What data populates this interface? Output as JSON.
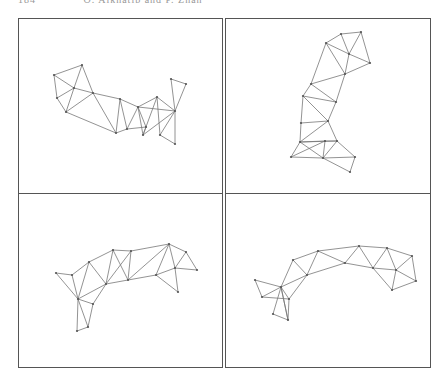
{
  "header": {
    "page_number": "184",
    "running_title": "O. Alkhatib and P. Zhan"
  },
  "colors": {
    "border": "#555555",
    "edge": "#777777",
    "vertex": "#555555"
  },
  "figure": {
    "layout": "2x2 grid of mesh panels",
    "panels": [
      {
        "id": "top-left",
        "box": [
          18,
          18,
          205,
          176
        ],
        "points": [
          [
            54,
            75
          ],
          [
            82,
            65
          ],
          [
            74,
            88
          ],
          [
            57,
            98
          ],
          [
            66,
            112
          ],
          [
            93,
            93
          ],
          [
            116,
            133
          ],
          [
            120,
            99
          ],
          [
            127,
            129
          ],
          [
            146,
            127
          ],
          [
            138,
            107
          ],
          [
            143,
            135
          ],
          [
            157,
            97
          ],
          [
            171,
            79
          ],
          [
            186,
            84
          ],
          [
            175,
            111
          ],
          [
            160,
            135
          ],
          [
            175,
            144
          ]
        ],
        "edges": [
          [
            0,
            1
          ],
          [
            0,
            2
          ],
          [
            0,
            3
          ],
          [
            1,
            2
          ],
          [
            1,
            5
          ],
          [
            2,
            3
          ],
          [
            2,
            4
          ],
          [
            2,
            5
          ],
          [
            3,
            4
          ],
          [
            4,
            5
          ],
          [
            4,
            6
          ],
          [
            5,
            6
          ],
          [
            5,
            7
          ],
          [
            6,
            7
          ],
          [
            6,
            8
          ],
          [
            7,
            8
          ],
          [
            7,
            10
          ],
          [
            8,
            10
          ],
          [
            8,
            9
          ],
          [
            9,
            10
          ],
          [
            10,
            11
          ],
          [
            9,
            11
          ],
          [
            10,
            12
          ],
          [
            11,
            12
          ],
          [
            10,
            15
          ],
          [
            12,
            15
          ],
          [
            13,
            14
          ],
          [
            13,
            15
          ],
          [
            14,
            15
          ],
          [
            12,
            16
          ],
          [
            15,
            16
          ],
          [
            15,
            17
          ],
          [
            16,
            17
          ],
          [
            11,
            15
          ]
        ]
      },
      {
        "id": "top-right",
        "box": [
          225,
          18,
          205,
          176
        ],
        "points": [
          [
            341,
            34
          ],
          [
            361,
            32
          ],
          [
            326,
            43
          ],
          [
            349,
            54
          ],
          [
            370,
            63
          ],
          [
            345,
            74
          ],
          [
            311,
            84
          ],
          [
            303,
            96
          ],
          [
            336,
            102
          ],
          [
            301,
            123
          ],
          [
            328,
            121
          ],
          [
            300,
            142
          ],
          [
            325,
            141
          ],
          [
            337,
            141
          ],
          [
            291,
            157
          ],
          [
            323,
            158
          ],
          [
            355,
            157
          ],
          [
            350,
            172
          ]
        ],
        "edges": [
          [
            0,
            1
          ],
          [
            0,
            2
          ],
          [
            0,
            3
          ],
          [
            1,
            3
          ],
          [
            1,
            4
          ],
          [
            2,
            3
          ],
          [
            3,
            4
          ],
          [
            2,
            5
          ],
          [
            3,
            5
          ],
          [
            4,
            5
          ],
          [
            2,
            6
          ],
          [
            5,
            6
          ],
          [
            6,
            7
          ],
          [
            6,
            8
          ],
          [
            5,
            8
          ],
          [
            7,
            8
          ],
          [
            7,
            9
          ],
          [
            8,
            10
          ],
          [
            7,
            10
          ],
          [
            9,
            10
          ],
          [
            9,
            11
          ],
          [
            10,
            11
          ],
          [
            10,
            13
          ],
          [
            11,
            12
          ],
          [
            11,
            13
          ],
          [
            12,
            13
          ],
          [
            11,
            14
          ],
          [
            11,
            15
          ],
          [
            12,
            15
          ],
          [
            13,
            15
          ],
          [
            14,
            15
          ],
          [
            13,
            16
          ],
          [
            15,
            16
          ],
          [
            15,
            17
          ],
          [
            16,
            17
          ],
          [
            12,
            14
          ]
        ]
      },
      {
        "id": "bottom-left",
        "box": [
          18,
          194,
          205,
          173
        ],
        "points": [
          [
            56,
            273
          ],
          [
            72,
            275
          ],
          [
            89,
            262
          ],
          [
            113,
            250
          ],
          [
            131,
            251
          ],
          [
            169,
            244
          ],
          [
            186,
            252
          ],
          [
            197,
            270
          ],
          [
            175,
            268
          ],
          [
            156,
            275
          ],
          [
            128,
            280
          ],
          [
            106,
            284
          ],
          [
            78,
            299
          ],
          [
            93,
            304
          ],
          [
            88,
            327
          ],
          [
            77,
            331
          ],
          [
            178,
            292
          ]
        ],
        "edges": [
          [
            0,
            1
          ],
          [
            0,
            12
          ],
          [
            1,
            12
          ],
          [
            1,
            2
          ],
          [
            2,
            12
          ],
          [
            2,
            3
          ],
          [
            2,
            11
          ],
          [
            3,
            11
          ],
          [
            3,
            4
          ],
          [
            4,
            11
          ],
          [
            4,
            10
          ],
          [
            3,
            10
          ],
          [
            4,
            5
          ],
          [
            5,
            10
          ],
          [
            5,
            9
          ],
          [
            9,
            10
          ],
          [
            5,
            6
          ],
          [
            5,
            8
          ],
          [
            6,
            8
          ],
          [
            6,
            7
          ],
          [
            7,
            8
          ],
          [
            8,
            9
          ],
          [
            8,
            16
          ],
          [
            9,
            16
          ],
          [
            10,
            11
          ],
          [
            11,
            12
          ],
          [
            11,
            13
          ],
          [
            12,
            13
          ],
          [
            12,
            14
          ],
          [
            12,
            15
          ],
          [
            13,
            14
          ],
          [
            14,
            15
          ]
        ]
      },
      {
        "id": "bottom-right",
        "box": [
          225,
          194,
          205,
          173
        ],
        "points": [
          [
            255,
            280
          ],
          [
            262,
            297
          ],
          [
            281,
            287
          ],
          [
            289,
            299
          ],
          [
            273,
            314
          ],
          [
            288,
            320
          ],
          [
            293,
            260
          ],
          [
            307,
            275
          ],
          [
            318,
            251
          ],
          [
            345,
            263
          ],
          [
            359,
            246
          ],
          [
            373,
            268
          ],
          [
            387,
            248
          ],
          [
            396,
            270
          ],
          [
            412,
            256
          ],
          [
            416,
            281
          ],
          [
            392,
            290
          ]
        ],
        "edges": [
          [
            0,
            1
          ],
          [
            0,
            2
          ],
          [
            1,
            2
          ],
          [
            1,
            3
          ],
          [
            2,
            3
          ],
          [
            2,
            4
          ],
          [
            2,
            5
          ],
          [
            3,
            5
          ],
          [
            4,
            5
          ],
          [
            2,
            6
          ],
          [
            2,
            7
          ],
          [
            3,
            7
          ],
          [
            6,
            7
          ],
          [
            6,
            8
          ],
          [
            7,
            8
          ],
          [
            7,
            9
          ],
          [
            8,
            9
          ],
          [
            8,
            10
          ],
          [
            9,
            10
          ],
          [
            9,
            11
          ],
          [
            10,
            11
          ],
          [
            10,
            12
          ],
          [
            11,
            12
          ],
          [
            11,
            13
          ],
          [
            12,
            13
          ],
          [
            12,
            14
          ],
          [
            13,
            14
          ],
          [
            13,
            15
          ],
          [
            14,
            15
          ],
          [
            13,
            16
          ],
          [
            15,
            16
          ],
          [
            11,
            16
          ],
          [
            2,
            5
          ]
        ]
      }
    ]
  }
}
